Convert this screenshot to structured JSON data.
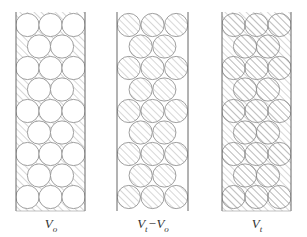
{
  "figure": {
    "stroke_color": "#888888",
    "hatch_color": "#9a9a9a",
    "background": "#ffffff",
    "rows": 9,
    "row_pattern": [
      3,
      2,
      3,
      2,
      3,
      2,
      3,
      2,
      3
    ],
    "circle_radius": 11.6,
    "first_row_y": 25,
    "row_pitch": 21.5,
    "top_y": 12,
    "bottom_y": 211,
    "panels": [
      {
        "id": "vo",
        "label_main": "V",
        "label_sub": "o",
        "label_rest": "",
        "label_rest_sub": "",
        "left": 16,
        "right": 85,
        "circles_hatched": false,
        "gaps_hatched": true,
        "closed_bottom": true
      },
      {
        "id": "vt-vo",
        "label_main": "V",
        "label_sub": "t",
        "label_rest": "−V",
        "label_rest_sub": "o",
        "left": 117,
        "right": 188,
        "circles_hatched": true,
        "gaps_hatched": false,
        "closed_bottom": false
      },
      {
        "id": "vt",
        "label_main": "V",
        "label_sub": "t",
        "label_rest": "",
        "label_rest_sub": "",
        "left": 222,
        "right": 291,
        "circles_hatched": true,
        "gaps_hatched": true,
        "closed_bottom": true
      }
    ]
  }
}
